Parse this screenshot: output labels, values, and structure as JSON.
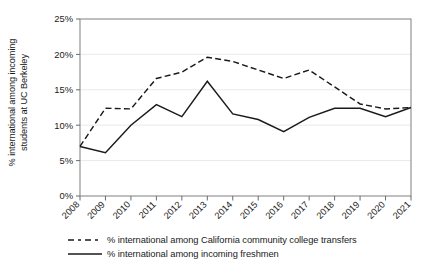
{
  "chart_data": {
    "type": "line",
    "title": "",
    "xlabel": "",
    "ylabel": "% international among incoming students at UC Berkeley",
    "ylabel_line1": "% international among incoming",
    "ylabel_line2": "students at UC Berkeley",
    "categories": [
      "2008",
      "2009",
      "2010",
      "2011",
      "2012",
      "2013",
      "2014",
      "2015",
      "2016",
      "2017",
      "2018",
      "2019",
      "2020",
      "2021"
    ],
    "x": [
      2008,
      2009,
      2010,
      2011,
      2012,
      2013,
      2014,
      2015,
      2016,
      2017,
      2018,
      2019,
      2020,
      2021
    ],
    "ylim": [
      0,
      25
    ],
    "xlim": [
      2008,
      2021
    ],
    "yticks": [
      0,
      5,
      10,
      15,
      20,
      25
    ],
    "ytick_labels": [
      "0%",
      "5%",
      "10%",
      "15%",
      "20%",
      "25%"
    ],
    "grid": "horizontal",
    "legend_position": "below-plot-left",
    "series": [
      {
        "name": "% international among California community college transfers",
        "style": "dashed",
        "color": "#1a1a1a",
        "values": [
          7.0,
          12.4,
          12.3,
          16.6,
          17.5,
          19.6,
          19.0,
          17.8,
          16.6,
          17.8,
          15.4,
          13.0,
          12.3,
          12.5
        ]
      },
      {
        "name": "% international among incoming freshmen",
        "style": "solid",
        "color": "#1a1a1a",
        "values": [
          7.0,
          6.1,
          10.0,
          12.9,
          11.2,
          16.2,
          11.6,
          10.8,
          9.1,
          11.1,
          12.4,
          12.4,
          11.2,
          12.5
        ]
      }
    ]
  },
  "legend": {
    "items": [
      {
        "label": "% international among California community college transfers",
        "style": "dashed"
      },
      {
        "label": "% international among incoming freshmen",
        "style": "solid"
      }
    ]
  }
}
